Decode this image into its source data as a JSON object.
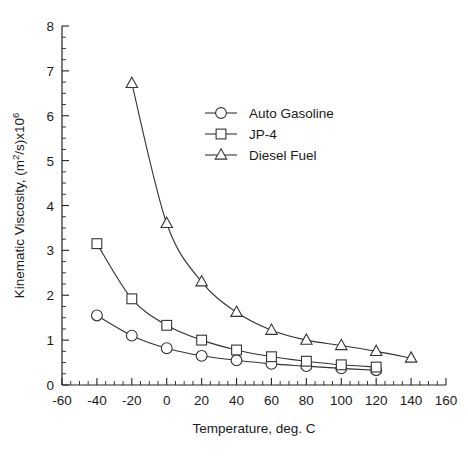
{
  "chart_data": {
    "type": "line",
    "title": "",
    "xlabel": "Temperature, deg. C",
    "ylabel": "Kinematic Viscosity, (m2/s)x106",
    "ylabel_parts": {
      "main": "Kinematic Viscosity, (m",
      "sup1": "2",
      "mid": "/s)x10",
      "sup2": "6"
    },
    "xlim": [
      -60,
      160
    ],
    "ylim": [
      0,
      8
    ],
    "xticks": [
      -60,
      -40,
      -20,
      0,
      20,
      40,
      60,
      80,
      100,
      120,
      140,
      160
    ],
    "yticks": [
      0,
      1,
      2,
      3,
      4,
      5,
      6,
      7,
      8
    ],
    "xtick_labels": [
      "-60",
      "-40",
      "-20",
      "0",
      "20",
      "40",
      "60",
      "80",
      "100",
      "120",
      "140",
      "160"
    ],
    "ytick_labels": [
      "0",
      "1",
      "2",
      "3",
      "4",
      "5",
      "6",
      "7",
      "8"
    ],
    "x_minor_step": 5,
    "y_minor_step": 0.25,
    "grid": false,
    "legend_position": "upper-center",
    "series": [
      {
        "name": "Auto Gasoline",
        "marker": "circle",
        "x": [
          -40,
          -20,
          0,
          20,
          40,
          60,
          80,
          100,
          120
        ],
        "values": [
          1.55,
          1.1,
          0.82,
          0.65,
          0.55,
          0.47,
          0.42,
          0.37,
          0.33
        ]
      },
      {
        "name": "JP-4",
        "marker": "square",
        "x": [
          -40,
          -20,
          0,
          20,
          40,
          60,
          80,
          100,
          120
        ],
        "values": [
          3.15,
          1.92,
          1.33,
          1.0,
          0.78,
          0.63,
          0.53,
          0.45,
          0.4
        ]
      },
      {
        "name": "Diesel Fuel",
        "marker": "triangle",
        "x": [
          -20,
          0,
          20,
          40,
          60,
          80,
          100,
          120,
          140
        ],
        "values": [
          6.72,
          3.6,
          2.3,
          1.62,
          1.22,
          1.0,
          0.88,
          0.75,
          0.6
        ]
      }
    ]
  },
  "legend": {
    "items": [
      {
        "label": "Auto Gasoline",
        "marker": "circle"
      },
      {
        "label": "JP-4",
        "marker": "square"
      },
      {
        "label": "Diesel Fuel",
        "marker": "triangle"
      }
    ]
  },
  "colors": {
    "axis": "#222222",
    "series": "#333333",
    "marker_fill": "#ffffff",
    "background": "#ffffff"
  }
}
